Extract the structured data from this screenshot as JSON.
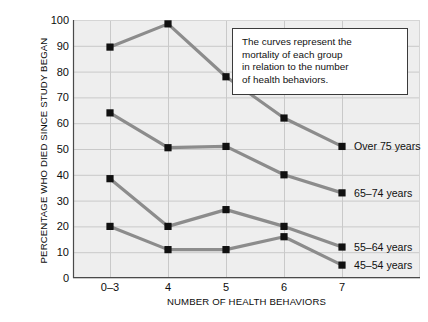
{
  "chart_data": {
    "type": "line",
    "title": "",
    "xlabel": "NUMBER OF HEALTH BEHAVIORS",
    "ylabel": "PERCENTAGE WHO DIED SINCE STUDY BEGAN",
    "categories": [
      "0–3",
      "4",
      "5",
      "6",
      "7"
    ],
    "ylim": [
      0,
      100
    ],
    "yticks": [
      0,
      10,
      20,
      30,
      40,
      50,
      60,
      70,
      80,
      90,
      100
    ],
    "grid": true,
    "legend_position": "inline-right-of-last-point",
    "series": [
      {
        "name": "Over 75 years",
        "values": [
          89.5,
          98.5,
          78,
          62,
          51
        ],
        "color": "#8c8c8c",
        "marker": "square",
        "marker_color": "#111111"
      },
      {
        "name": "65–74 years",
        "values": [
          64,
          50.5,
          51,
          40,
          33
        ],
        "color": "#8c8c8c",
        "marker": "square",
        "marker_color": "#111111"
      },
      {
        "name": "55–64 years",
        "values": [
          38.5,
          20,
          26.5,
          20,
          12
        ],
        "color": "#8c8c8c",
        "marker": "square",
        "marker_color": "#111111"
      },
      {
        "name": "45–54 years",
        "values": [
          20,
          11,
          11,
          16,
          5
        ],
        "color": "#8c8c8c",
        "marker": "square",
        "marker_color": "#111111"
      }
    ],
    "annotation": {
      "lines": [
        "The curves represent the",
        "mortality of each group",
        "in relation to the number",
        "of health behaviors."
      ]
    }
  },
  "style": {
    "plot_background": "#eeeeee",
    "grid_color": "#c9c9c9",
    "line_color": "#8c8c8c",
    "marker_color": "#111111",
    "text_color": "#111111",
    "annotation_border": "#3a3a3a",
    "page_background": "#ffffff"
  }
}
